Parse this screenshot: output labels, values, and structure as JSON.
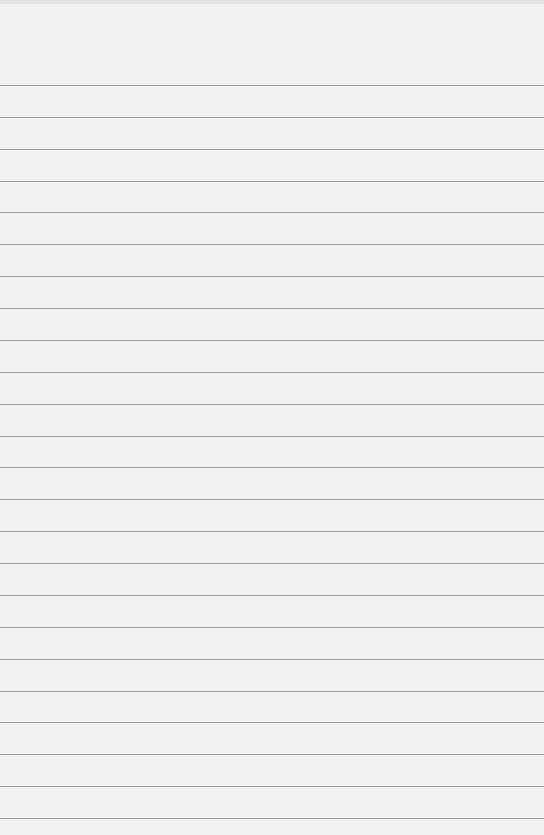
{
  "paper": {
    "type": "lined-paper",
    "background_color": "#f2f2f2",
    "line_color": "#8f8f8f",
    "first_line_y": 85,
    "line_spacing": 31.87,
    "line_count": 24
  }
}
